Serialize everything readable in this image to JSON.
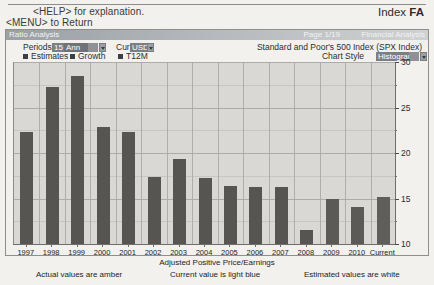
{
  "header": {
    "help_line1": "<HELP> for explanation.",
    "help_line2": "<MENU> to Return",
    "index_label": "Index",
    "index_code": "FA"
  },
  "title_strip": {
    "screen_title": "Ratio Analysis",
    "page": "Page 1/19",
    "section": "Financial Analysis"
  },
  "controls": {
    "periods_label": "Periods",
    "periods_count": "15",
    "periods_freq": "Ann",
    "currency_label": "Cur",
    "currency_value": "USD",
    "security_name": "Standard and Poor's 500 Index (SPX Index)",
    "chart_style_label": "Chart Style",
    "chart_style_value": "Histogram",
    "toggles": [
      {
        "label": "Estimates",
        "checked": true
      },
      {
        "label": "Growth",
        "checked": true
      },
      {
        "label": "T12M",
        "checked": true
      }
    ]
  },
  "footnotes": {
    "actual": "Actual values are amber",
    "current": "Current value is light blue",
    "estimated": "Estimated values are white"
  },
  "chart_data": {
    "type": "bar",
    "title": "Ratio Analysis",
    "xlabel": "Adjusted Positive Price/Earnings",
    "ylabel": "",
    "ylim": [
      10,
      30
    ],
    "yticks": [
      10,
      15,
      20,
      25,
      30
    ],
    "grid": true,
    "legend": "none",
    "categories": [
      "1997",
      "1998",
      "1999",
      "2000",
      "2001",
      "2002",
      "2003",
      "2004",
      "2005",
      "2006",
      "2007",
      "2008",
      "2009",
      "2010",
      "Current"
    ],
    "values": [
      22.3,
      27.3,
      28.5,
      22.9,
      22.3,
      17.4,
      19.3,
      17.2,
      16.4,
      16.3,
      16.3,
      11.5,
      15.0,
      14.1,
      15.2
    ],
    "series": [
      {
        "name": "Adjusted Positive Price/Earnings",
        "values": [
          22.3,
          27.3,
          28.5,
          22.9,
          22.3,
          17.4,
          19.3,
          17.2,
          16.4,
          16.3,
          16.3,
          11.5,
          15.0,
          14.1,
          15.2
        ],
        "kinds": [
          "actual",
          "actual",
          "actual",
          "actual",
          "actual",
          "actual",
          "actual",
          "actual",
          "actual",
          "actual",
          "actual",
          "actual",
          "estimate",
          "estimate",
          "current"
        ]
      }
    ]
  },
  "colors": {
    "bar": "#565551",
    "plot_bg": "#d9d8d4",
    "page_bg": "#f2f1ee",
    "strip": "#9aa0a6",
    "field": "#6f7378"
  }
}
